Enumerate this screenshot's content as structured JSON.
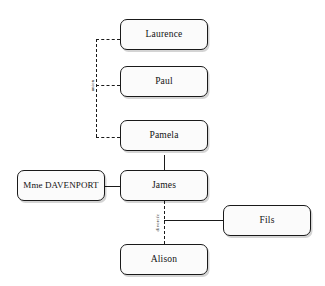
{
  "diagram": {
    "type": "family-tree",
    "title": "",
    "background_color": "#ffffff",
    "line_color": "#1a1a1a",
    "node_fill_color": "#fbfbfb",
    "nodes": [
      {
        "id": "laurence",
        "label": "Laurence"
      },
      {
        "id": "paul",
        "label": "Paul"
      },
      {
        "id": "pamela",
        "label": "Pamela"
      },
      {
        "id": "mme_davenport",
        "label": "Mme DAVENPORT"
      },
      {
        "id": "james",
        "label": "James"
      },
      {
        "id": "fils",
        "label": "Fils"
      },
      {
        "id": "alison",
        "label": "Alison"
      }
    ],
    "edge_labels": [
      {
        "id": "union",
        "label": "union"
      },
      {
        "id": "divorcee",
        "label": "divorcée"
      }
    ]
  }
}
